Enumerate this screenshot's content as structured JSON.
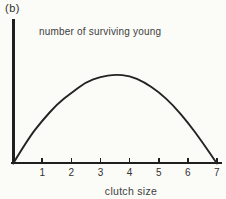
{
  "figure": {
    "panel_label": "(b)"
  },
  "chart_data": {
    "type": "line",
    "title": "",
    "xlabel": "clutch size",
    "ylabel": "number of surviving young",
    "x_ticks": [
      "1",
      "2",
      "3",
      "4",
      "5",
      "6",
      "7"
    ],
    "xlim": [
      0,
      7.3
    ],
    "ylim_relative": [
      0,
      1.1
    ],
    "grid": false,
    "legend": false,
    "line_color": "#232323",
    "axis_color": "#1f1f1f",
    "series": [
      {
        "name": "number of surviving young vs clutch size",
        "x_clutch_size": [
          0,
          0.5,
          1,
          1.5,
          2,
          2.5,
          3,
          3.5,
          4,
          4.5,
          5,
          5.5,
          6,
          6.5,
          7
        ],
        "y_relative": [
          0,
          0.27,
          0.48,
          0.66,
          0.79,
          0.91,
          0.97,
          0.995,
          0.98,
          0.91,
          0.8,
          0.65,
          0.46,
          0.24,
          0
        ]
      }
    ],
    "peak": {
      "clutch_size": 3.6,
      "y_relative": 1.0
    },
    "zeros_at_clutch_size": [
      0,
      7
    ]
  }
}
